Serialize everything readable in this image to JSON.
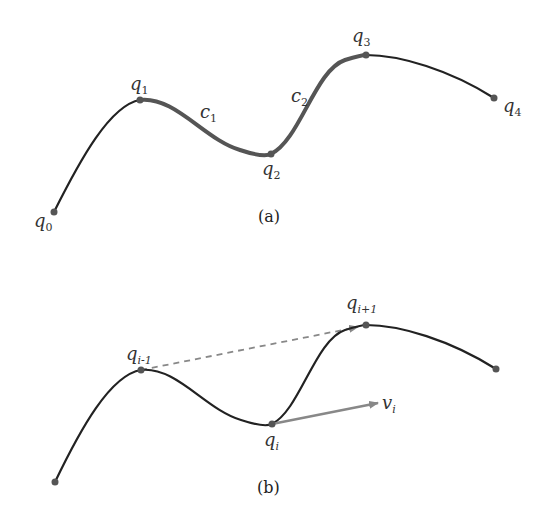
{
  "panel_a": {
    "caption": "(a)",
    "points": [
      {
        "base": "q",
        "sub": "0"
      },
      {
        "base": "q",
        "sub": "1"
      },
      {
        "base": "q",
        "sub": "2"
      },
      {
        "base": "q",
        "sub": "3"
      },
      {
        "base": "q",
        "sub": "4"
      }
    ],
    "segments": [
      {
        "base": "c",
        "sub": "1"
      },
      {
        "base": "c",
        "sub": "2"
      }
    ]
  },
  "panel_b": {
    "caption": "(b)",
    "points": [
      {
        "base": "q",
        "sub": "i-1"
      },
      {
        "base": "q",
        "sub": "i"
      },
      {
        "base": "q",
        "sub": "i+1"
      }
    ],
    "vector": {
      "base": "v",
      "sub": "i"
    }
  },
  "colors": {
    "curve": "#222222",
    "highlight": "#555555",
    "point": "#555555",
    "arrow": "#888888"
  }
}
